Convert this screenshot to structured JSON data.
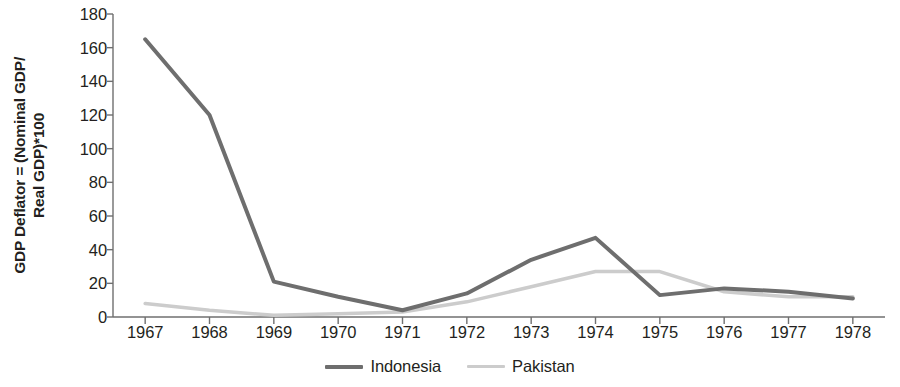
{
  "chart_data": {
    "type": "line",
    "title": "",
    "xlabel": "",
    "ylabel": "GDP Deflator = (Nominal GDP/ Real GDP)*100",
    "ylabel_lines": [
      "GDP Deflator = (Nominal GDP/",
      "Real GDP)*100"
    ],
    "categories": [
      "1967",
      "1968",
      "1969",
      "1970",
      "1971",
      "1972",
      "1973",
      "1974",
      "1975",
      "1976",
      "1977",
      "1978"
    ],
    "x": [
      1967,
      1968,
      1969,
      1970,
      1971,
      1972,
      1973,
      1974,
      1975,
      1976,
      1977,
      1978
    ],
    "ylim": [
      0,
      180
    ],
    "yticks": [
      0,
      20,
      40,
      60,
      80,
      100,
      120,
      140,
      160,
      180
    ],
    "grid": false,
    "legend_position": "bottom-center",
    "series": [
      {
        "name": "Indonesia",
        "color": "#6e6e6e",
        "width": 4,
        "values": [
          165,
          120,
          21,
          12,
          4,
          14,
          34,
          47,
          13,
          17,
          15,
          11
        ]
      },
      {
        "name": "Pakistan",
        "color": "#cccccc",
        "width": 3.5,
        "values": [
          8,
          4,
          1,
          2,
          3,
          9,
          18,
          27,
          27,
          15,
          12,
          12
        ]
      }
    ]
  },
  "axis": {
    "axis_color": "#6f6f6f",
    "tick_color": "#6f6f6f"
  }
}
